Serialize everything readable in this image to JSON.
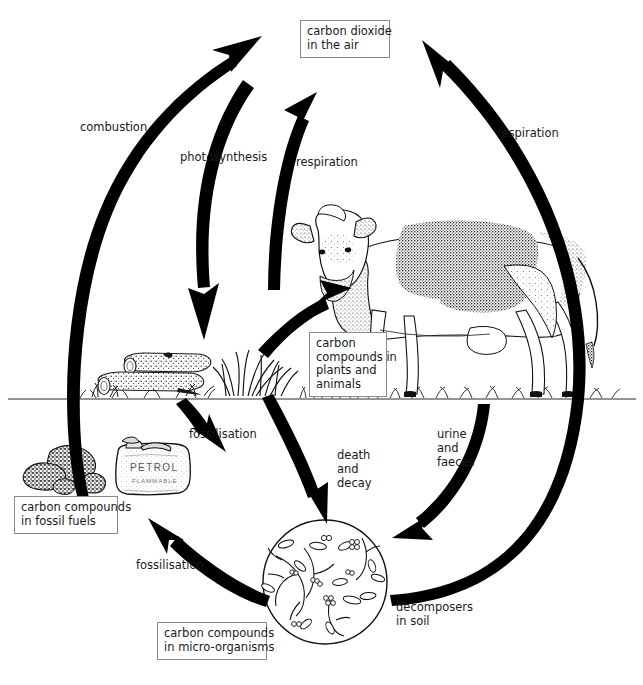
{
  "diagram": {
    "background_color": "#ffffff",
    "ink_color": "#000000",
    "box_border_color": "#8a8a8a",
    "text_color": "#1a1a1a"
  },
  "boxes": {
    "carbon_dioxide": "carbon dioxide\nin the air",
    "plants_animals": "carbon\ncompounds in\nplants and\nanimals",
    "fossil_fuels": "carbon compounds\nin fossil fuels",
    "micro_organisms": "carbon compounds\nin micro-organisms"
  },
  "labels": {
    "combustion": "combustion",
    "photosynthesis": "photosynthesis",
    "respiration_plants": "respiration",
    "respiration_animals": "respiration",
    "fossilisation_wood": "fossilisation",
    "fossilisation_micro": "fossilisation",
    "death_and_decay": "death\nand\ndecay",
    "urine_and_faeces": "urine\nand\nfaeces",
    "decomposers": "decomposers\nin soil"
  },
  "illustrations": {
    "cow": "cow-illustration",
    "logs": "logs-illustration",
    "grass": "grass-illustration",
    "coal": "coal-lumps-illustration",
    "petrol_can": "petrol-can-illustration",
    "petrol_can_text_main": "PETROL",
    "petrol_can_text_sub": "FLAMMABLE",
    "microscope_circle": "decomposers-microscope-illustration"
  },
  "arrows": [
    {
      "name": "combustion-arrow",
      "from": "fossil fuels",
      "to": "carbon dioxide in the air",
      "label": "combustion"
    },
    {
      "name": "photosynthesis-arrow",
      "from": "carbon dioxide in the air",
      "to": "plants",
      "label": "photosynthesis"
    },
    {
      "name": "respiration-plants-arrow",
      "from": "plants",
      "to": "carbon dioxide in the air",
      "label": "respiration"
    },
    {
      "name": "respiration-animals-arrow",
      "from": "decomposers in soil",
      "to": "carbon dioxide in the air",
      "label": "respiration"
    },
    {
      "name": "feeding-arrow",
      "from": "plants",
      "to": "animals",
      "label": ""
    },
    {
      "name": "death-decay-arrow",
      "from": "plants and animals",
      "to": "decomposers in soil",
      "label": "death and decay"
    },
    {
      "name": "urine-faeces-arrow",
      "from": "animals",
      "to": "decomposers in soil",
      "label": "urine and faeces"
    },
    {
      "name": "fossilisation-wood-arrow",
      "from": "plants",
      "to": "fossil fuels",
      "label": "fossilisation"
    },
    {
      "name": "fossilisation-micro-arrow",
      "from": "micro-organisms",
      "to": "fossil fuels",
      "label": "fossilisation"
    }
  ]
}
